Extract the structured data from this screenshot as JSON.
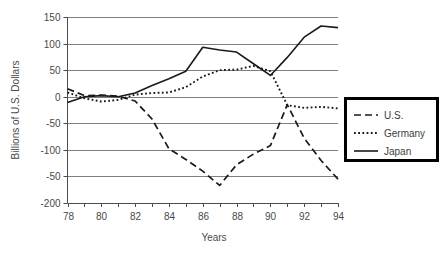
{
  "chart_data": {
    "type": "line",
    "title": "",
    "xlabel": "Years",
    "ylabel": "Billions of U.S. Dollars",
    "x": [
      78,
      79,
      80,
      81,
      82,
      83,
      84,
      85,
      86,
      87,
      88,
      89,
      90,
      91,
      92,
      93,
      94
    ],
    "xtick_labels": [
      "78",
      "",
      "80",
      "",
      "82",
      "",
      "84",
      "",
      "86",
      "",
      "88",
      "",
      "90",
      "",
      "92",
      "",
      "94"
    ],
    "xlim": [
      78,
      94
    ],
    "ylim": [
      -200,
      150
    ],
    "ytick_values": [
      150,
      100,
      50,
      0,
      -50,
      -100,
      -150,
      -200
    ],
    "ytick_labels": [
      "150",
      "100",
      "50",
      "0",
      "-50",
      "-100",
      "-50",
      "-200"
    ],
    "grid": true,
    "grid_axis": "y",
    "legend_position": "right",
    "series": [
      {
        "name": "U.S.",
        "style": "dashed",
        "values": [
          15,
          2,
          3,
          1,
          -8,
          -42,
          -98,
          -118,
          -140,
          -167,
          -128,
          -108,
          -92,
          -15,
          -78,
          -120,
          -155
        ]
      },
      {
        "name": "Germany",
        "style": "dotted",
        "values": [
          8,
          -3,
          -9,
          -6,
          4,
          7,
          8,
          18,
          38,
          50,
          51,
          58,
          48,
          -16,
          -21,
          -19,
          -22
        ]
      },
      {
        "name": "Japan",
        "style": "solid",
        "values": [
          -11,
          0,
          2,
          0,
          7,
          21,
          34,
          48,
          93,
          88,
          84,
          62,
          40,
          74,
          112,
          133,
          130
        ]
      }
    ]
  },
  "legend": {
    "entries": [
      {
        "label": "U.S."
      },
      {
        "label": "Germany"
      },
      {
        "label": "Japan"
      }
    ]
  }
}
